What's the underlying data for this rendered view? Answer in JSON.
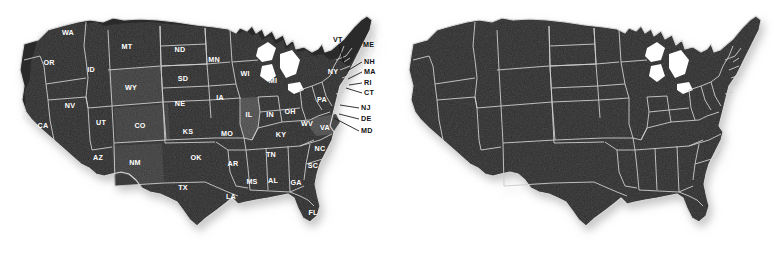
{
  "page": {
    "background_color": "#ffffff",
    "panel_count": 2
  },
  "colors": {
    "land": "#2b2b2b",
    "land_light": "#4a4a4a",
    "land_mid": "#3a3a3a",
    "state_border": "#c9c9c9",
    "coast_outline": "#d8d8d8",
    "state_label_text": "#ffffff",
    "callout_text": "#111111",
    "callout_line": "#111111",
    "shadow": "#bdbdbd"
  },
  "maps": [
    {
      "id": "labeled-map",
      "name": "us-map-labeled",
      "position": "left",
      "labels_visible": true,
      "callouts_visible": true
    },
    {
      "id": "blank-map",
      "name": "us-map-blank",
      "position": "right",
      "labels_visible": false,
      "callouts_visible": false
    }
  ],
  "state_labels": [
    {
      "abbr": "WA",
      "x": 68,
      "y": 33
    },
    {
      "abbr": "OR",
      "x": 49,
      "y": 63
    },
    {
      "abbr": "ID",
      "x": 91,
      "y": 70
    },
    {
      "abbr": "MT",
      "x": 127,
      "y": 47
    },
    {
      "abbr": "ND",
      "x": 180,
      "y": 50
    },
    {
      "abbr": "MN",
      "x": 214,
      "y": 60
    },
    {
      "abbr": "WI",
      "x": 245,
      "y": 74
    },
    {
      "abbr": "MI",
      "x": 273,
      "y": 81
    },
    {
      "abbr": "WY",
      "x": 131,
      "y": 88
    },
    {
      "abbr": "SD",
      "x": 183,
      "y": 79
    },
    {
      "abbr": "NE",
      "x": 180,
      "y": 104
    },
    {
      "abbr": "IA",
      "x": 220,
      "y": 98
    },
    {
      "abbr": "NV",
      "x": 70,
      "y": 106
    },
    {
      "abbr": "UT",
      "x": 101,
      "y": 123
    },
    {
      "abbr": "CO",
      "x": 140,
      "y": 126
    },
    {
      "abbr": "CA",
      "x": 43,
      "y": 126
    },
    {
      "abbr": "KS",
      "x": 188,
      "y": 132
    },
    {
      "abbr": "MO",
      "x": 227,
      "y": 134
    },
    {
      "abbr": "IL",
      "x": 249,
      "y": 115
    },
    {
      "abbr": "IN",
      "x": 270,
      "y": 115
    },
    {
      "abbr": "OH",
      "x": 290,
      "y": 112
    },
    {
      "abbr": "PA",
      "x": 322,
      "y": 100
    },
    {
      "abbr": "NY",
      "x": 333,
      "y": 72
    },
    {
      "abbr": "KY",
      "x": 281,
      "y": 135
    },
    {
      "abbr": "WV",
      "x": 307,
      "y": 124
    },
    {
      "abbr": "VA",
      "x": 325,
      "y": 128
    },
    {
      "abbr": "AZ",
      "x": 98,
      "y": 158
    },
    {
      "abbr": "NM",
      "x": 135,
      "y": 163
    },
    {
      "abbr": "OK",
      "x": 196,
      "y": 158
    },
    {
      "abbr": "AR",
      "x": 233,
      "y": 164
    },
    {
      "abbr": "TN",
      "x": 271,
      "y": 155
    },
    {
      "abbr": "NC",
      "x": 320,
      "y": 149
    },
    {
      "abbr": "SC",
      "x": 313,
      "y": 166
    },
    {
      "abbr": "MS",
      "x": 252,
      "y": 182
    },
    {
      "abbr": "AL",
      "x": 273,
      "y": 181
    },
    {
      "abbr": "GA",
      "x": 296,
      "y": 183
    },
    {
      "abbr": "LA",
      "x": 231,
      "y": 197
    },
    {
      "abbr": "TX",
      "x": 183,
      "y": 188
    },
    {
      "abbr": "FL",
      "x": 313,
      "y": 213
    }
  ],
  "callouts": [
    {
      "abbr": "VT",
      "label_x": 333,
      "label_y": 40,
      "line": "M 339 45 L 344 63"
    },
    {
      "abbr": "ME",
      "label_x": 363,
      "label_y": 45,
      "line": ""
    },
    {
      "abbr": "NH",
      "label_x": 364,
      "label_y": 62,
      "line": "M 362 62 L 347 71"
    },
    {
      "abbr": "MA",
      "label_x": 364,
      "label_y": 72,
      "line": "M 362 72 L 348 79"
    },
    {
      "abbr": "RI",
      "label_x": 364,
      "label_y": 83,
      "line": "M 362 83 L 349 85"
    },
    {
      "abbr": "CT",
      "label_x": 364,
      "label_y": 93,
      "line": "M 362 93 L 346 88"
    },
    {
      "abbr": "NJ",
      "label_x": 361,
      "label_y": 108,
      "line": "M 359 108 L 340 105"
    },
    {
      "abbr": "DE",
      "label_x": 361,
      "label_y": 119,
      "line": "M 359 119 L 339 114"
    },
    {
      "abbr": "MD",
      "label_x": 361,
      "label_y": 131,
      "line": "M 359 131 L 334 118"
    }
  ],
  "highlighted_states": [
    {
      "abbr": "IL",
      "shade": "light"
    },
    {
      "abbr": "VA",
      "shade": "light"
    },
    {
      "abbr": "CO",
      "shade": "mid"
    },
    {
      "abbr": "WY",
      "shade": "mid"
    },
    {
      "abbr": "NM",
      "shade": "mid"
    }
  ]
}
